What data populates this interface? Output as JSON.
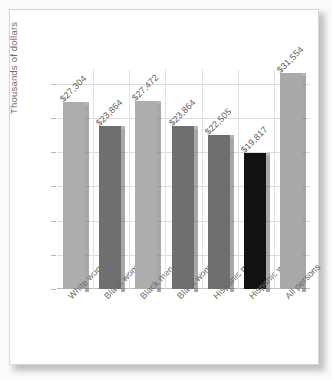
{
  "chart_data": {
    "type": "bar",
    "title": "",
    "xlabel": "",
    "ylabel": "Thousands of dollars",
    "ylim": [
      0,
      32
    ],
    "yticks": [
      0,
      5,
      10,
      15,
      20,
      25,
      30
    ],
    "ytick_labels": [
      "0",
      "5",
      "10",
      "15",
      "20",
      "25",
      "30"
    ],
    "grid": true,
    "legend": "none",
    "categories": [
      "White women",
      "Black women",
      "Black men",
      "Black women",
      "Hispanic men",
      "Hispanic women",
      "All persons"
    ],
    "values": [
      27.304,
      23.864,
      27.472,
      23.864,
      22.505,
      19.817,
      31.554
    ],
    "data_labels": [
      "$27,304",
      "$23,864",
      "$27,472",
      "$23,864",
      "$22,505",
      "$19,817",
      "$31,554"
    ],
    "bar_colors": [
      "#adadad",
      "#6f6f6f",
      "#adadad",
      "#6f6f6f",
      "#6f6f6f",
      "#121212",
      "#a9a9a9"
    ]
  },
  "colors": {
    "page_background": "#ffffff",
    "grid": "#dcdcdc",
    "axis": "#bdbdbd",
    "text": "#6a6a6a",
    "light_bar": "#adadad",
    "mid_bar": "#6f6f6f",
    "dark_bar": "#121212",
    "shadow": "#8f8f8f"
  }
}
